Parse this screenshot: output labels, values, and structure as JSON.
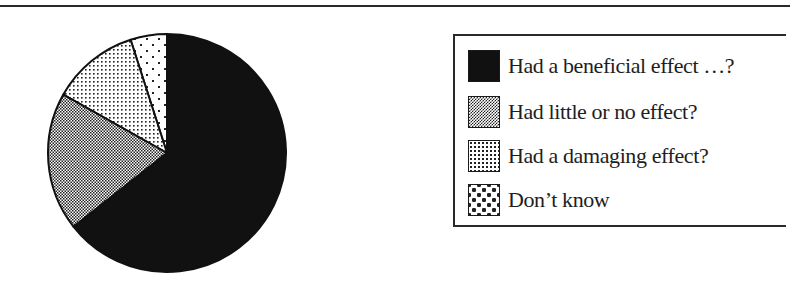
{
  "chart_data": {
    "type": "pie",
    "title": "",
    "start_angle_deg": 0,
    "direction": "counterclockwise",
    "slices": [
      {
        "label": "Don’t know",
        "value": 5,
        "pattern": "sparse-dots",
        "color": "#ffffff"
      },
      {
        "label": "Had a damaging effect?",
        "value": 12,
        "pattern": "dense-dots",
        "color": "#ffffff"
      },
      {
        "label": "Had little or no effect?",
        "value": 19,
        "pattern": "checker",
        "color": "#ffffff"
      },
      {
        "label": "Had a beneficial effect …?",
        "value": 65,
        "pattern": "solid",
        "color": "#111111"
      }
    ],
    "legend": {
      "position": "right",
      "entries": [
        "Had a beneficial effect …?",
        "Had little or no effect?",
        "Had a damaging effect?",
        "Don’t know"
      ]
    }
  },
  "legend": {
    "items": [
      {
        "label": "Had a beneficial effect …?",
        "pattern": "solid"
      },
      {
        "label": "Had little or no effect?",
        "pattern": "checker"
      },
      {
        "label": "Had a damaging effect?",
        "pattern": "dense-dots"
      },
      {
        "label": "Don’t know",
        "pattern": "sparse-dots"
      }
    ]
  },
  "colors": {
    "ink": "#111111",
    "paper": "#ffffff"
  }
}
